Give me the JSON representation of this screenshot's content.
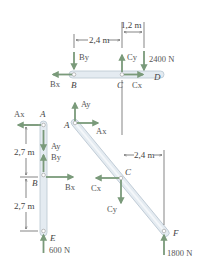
{
  "diagram": {
    "colors": {
      "member_fill": "#e4ebf1",
      "member_stroke": "#b9c6d1",
      "force_arrow": "#7a9a7a",
      "text": "#444444"
    },
    "members": [
      {
        "name": "BCD",
        "type": "horizontal",
        "points": [
          "B",
          "C",
          "D"
        ]
      },
      {
        "name": "ABE",
        "type": "vertical",
        "points": [
          "A",
          "B",
          "E"
        ]
      },
      {
        "name": "ACF",
        "type": "diagonal",
        "points": [
          "A",
          "C",
          "F"
        ]
      }
    ],
    "dimensions": {
      "top_bc": "2,4 m",
      "top_cd": "1,2 m",
      "left_ab": "2,7 m",
      "left_be": "2,7 m",
      "right_cf": "2,4 m"
    },
    "points": {
      "top_B": "B",
      "top_C": "C",
      "top_D": "D",
      "left_A": "A",
      "left_B": "B",
      "left_E": "E",
      "diag_A": "A",
      "diag_C": "C",
      "diag_F": "F"
    },
    "forces": {
      "top_By": "By",
      "top_Bx": "Bx",
      "top_Cy": "Cy",
      "top_Cx": "Cx",
      "top_load": "2400 N",
      "left_Ax": "Ax",
      "left_Ay": "Ay",
      "left_By": "By",
      "left_Bx": "Bx",
      "left_load": "600 N",
      "diag_Ay": "Ay",
      "diag_Ax": "Ax",
      "diag_Cx": "Cx",
      "diag_Cy": "Cy",
      "diag_load": "1800 N"
    }
  }
}
